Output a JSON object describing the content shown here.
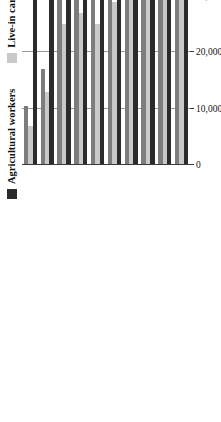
{
  "chart_data": {
    "type": "bar",
    "orientation": "horizontal",
    "title": "",
    "xlabel": "",
    "ylabel": "",
    "grid": true,
    "legend_position": "top-left",
    "xlim": [
      0,
      60000
    ],
    "categories": [
      "2008",
      "2009",
      "2010",
      "2011",
      "2012",
      "2013",
      "2014",
      "2015",
      "2016",
      "2017"
    ],
    "tick_labels": [
      "0",
      "10,000",
      "20,000",
      "30,000",
      "40,000",
      "50,000",
      "60,000"
    ],
    "tick_values": [
      0,
      10000,
      20000,
      30000,
      40000,
      50000,
      60000
    ],
    "series": [
      {
        "name": "Agricultural workers",
        "color": "#2b2b2b",
        "values": [
          34000,
          35000,
          35500,
          36500,
          38000,
          41500,
          44500,
          45500,
          49000,
          55000
        ]
      },
      {
        "name": "Live-in caregivers",
        "color": "#c9c9c9",
        "values": [
          40000,
          41500,
          41000,
          34000,
          29000,
          25000,
          27000,
          25000,
          13000,
          7000
        ]
      },
      {
        "name": "Lower-skilled",
        "color": "#7d7d7d",
        "values": [
          33000,
          39500,
          39500,
          31000,
          32500,
          38500,
          40000,
          33500,
          17000,
          10500
        ]
      }
    ]
  },
  "legend": {
    "items": [
      {
        "label": "Agricultural workers",
        "color": "#2b2b2b"
      },
      {
        "label": "Live-in caregivers",
        "color": "#c9c9c9"
      },
      {
        "label": "Lower-skilled",
        "color": "#7d7d7d"
      }
    ]
  },
  "colors": {
    "axis": "#3a3a3a",
    "grid": "#9b9b9b",
    "background": "#ffffff"
  }
}
